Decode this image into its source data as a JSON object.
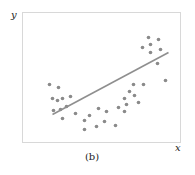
{
  "chart_data": {
    "type": "scatter",
    "title": "",
    "caption": "(b)",
    "xlabel": "x",
    "ylabel": "y",
    "grid": false,
    "legend": null,
    "xlim": [
      0,
      158
    ],
    "ylim": [
      0,
      130
    ],
    "colors": {
      "points": "#8a8a8a",
      "fit_line": "#8f8f8f",
      "frame": "#d8d8d8"
    },
    "points": [
      [
        27,
        58
      ],
      [
        36,
        55
      ],
      [
        30,
        44
      ],
      [
        35,
        42
      ],
      [
        40,
        44
      ],
      [
        48,
        46
      ],
      [
        31,
        32
      ],
      [
        38,
        33
      ],
      [
        44,
        36
      ],
      [
        40,
        24
      ],
      [
        53,
        29
      ],
      [
        62,
        22
      ],
      [
        67,
        27
      ],
      [
        62,
        13
      ],
      [
        74,
        16
      ],
      [
        82,
        21
      ],
      [
        84,
        31
      ],
      [
        76,
        34
      ],
      [
        93,
        17
      ],
      [
        96,
        35
      ],
      [
        102,
        44
      ],
      [
        104,
        38
      ],
      [
        102,
        31
      ],
      [
        107,
        51
      ],
      [
        111,
        58
      ],
      [
        112,
        47
      ],
      [
        116,
        40
      ],
      [
        121,
        58
      ],
      [
        120,
        95
      ],
      [
        126,
        105
      ],
      [
        128,
        98
      ],
      [
        136,
        103
      ],
      [
        138,
        93
      ],
      [
        135,
        79
      ],
      [
        128,
        90
      ],
      [
        143,
        62
      ]
    ],
    "fit_line": {
      "x1": 30,
      "y1": 28,
      "x2": 146,
      "y2": 90
    }
  }
}
